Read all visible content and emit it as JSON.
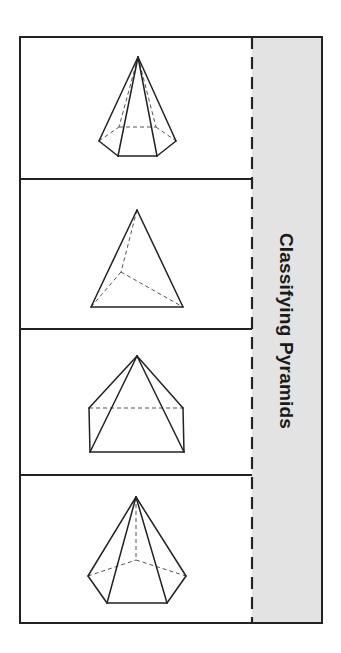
{
  "title": "Classifying Pyramids",
  "colors": {
    "stroke": "#222222",
    "tab_fill": "#e3e3e3",
    "page": "#ffffff"
  },
  "layout": {
    "frame": {
      "left": 20,
      "top": 37,
      "right": 322,
      "bottom": 623
    },
    "fold_line_x": 252,
    "dividers_y": [
      179,
      329,
      475
    ]
  },
  "flaps": [
    {
      "index": 1,
      "shape": "hexagonal pyramid",
      "apex": [
        138,
        57
      ],
      "solid_edges": [
        [
          [
            138,
            57
          ],
          [
            99,
            141
          ]
        ],
        [
          [
            138,
            57
          ],
          [
            118,
            156
          ]
        ],
        [
          [
            138,
            57
          ],
          [
            157,
            156
          ]
        ],
        [
          [
            138,
            57
          ],
          [
            176,
            141
          ]
        ],
        [
          [
            99,
            141
          ],
          [
            118,
            156
          ]
        ],
        [
          [
            118,
            156
          ],
          [
            157,
            156
          ]
        ],
        [
          [
            157,
            156
          ],
          [
            176,
            141
          ]
        ]
      ],
      "dashed_edges": [
        [
          [
            138,
            57
          ],
          [
            119,
            127
          ]
        ],
        [
          [
            138,
            57
          ],
          [
            156,
            127
          ]
        ],
        [
          [
            99,
            141
          ],
          [
            119,
            127
          ]
        ],
        [
          [
            119,
            127
          ],
          [
            156,
            127
          ]
        ],
        [
          [
            156,
            127
          ],
          [
            176,
            141
          ]
        ]
      ]
    },
    {
      "index": 2,
      "shape": "triangular pyramid",
      "apex": [
        137,
        210
      ],
      "solid_edges": [
        [
          [
            137,
            210
          ],
          [
            91,
            307
          ]
        ],
        [
          [
            137,
            210
          ],
          [
            183,
            307
          ]
        ],
        [
          [
            91,
            307
          ],
          [
            183,
            307
          ]
        ]
      ],
      "dashed_edges": [
        [
          [
            137,
            210
          ],
          [
            121,
            272
          ]
        ],
        [
          [
            121,
            272
          ],
          [
            91,
            307
          ]
        ],
        [
          [
            121,
            272
          ],
          [
            183,
            307
          ]
        ]
      ]
    },
    {
      "index": 3,
      "shape": "rectangular pyramid",
      "apex": [
        137,
        356
      ],
      "solid_edges": [
        [
          [
            137,
            356
          ],
          [
            89,
            408
          ]
        ],
        [
          [
            137,
            356
          ],
          [
            183,
            408
          ]
        ],
        [
          [
            137,
            356
          ],
          [
            90,
            452
          ]
        ],
        [
          [
            137,
            356
          ],
          [
            184,
            452
          ]
        ],
        [
          [
            89,
            408
          ],
          [
            90,
            452
          ]
        ],
        [
          [
            183,
            408
          ],
          [
            184,
            452
          ]
        ],
        [
          [
            90,
            452
          ],
          [
            184,
            452
          ]
        ]
      ],
      "dashed_edges": [
        [
          [
            89,
            408
          ],
          [
            183,
            408
          ]
        ]
      ]
    },
    {
      "index": 4,
      "shape": "pentagonal pyramid",
      "apex": [
        136,
        497
      ],
      "solid_edges": [
        [
          [
            136,
            497
          ],
          [
            88,
            576
          ]
        ],
        [
          [
            136,
            497
          ],
          [
            107,
            603
          ]
        ],
        [
          [
            136,
            497
          ],
          [
            167,
            603
          ]
        ],
        [
          [
            136,
            497
          ],
          [
            186,
            576
          ]
        ],
        [
          [
            88,
            576
          ],
          [
            107,
            603
          ]
        ],
        [
          [
            107,
            603
          ],
          [
            167,
            603
          ]
        ],
        [
          [
            167,
            603
          ],
          [
            186,
            576
          ]
        ]
      ],
      "dashed_edges": [
        [
          [
            136,
            497
          ],
          [
            136,
            560
          ]
        ],
        [
          [
            88,
            576
          ],
          [
            136,
            560
          ]
        ],
        [
          [
            136,
            560
          ],
          [
            186,
            576
          ]
        ]
      ]
    }
  ]
}
